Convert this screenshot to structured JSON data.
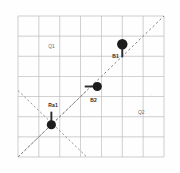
{
  "figure": {
    "background_color": "#fefefe",
    "plot_area": {
      "x": 18,
      "y": 16,
      "width": 146,
      "height": 141
    }
  },
  "chart_data": {
    "type": "scatter",
    "title": "",
    "xlabel": "",
    "ylabel": "",
    "xlim": [
      0,
      7
    ],
    "ylim": [
      0,
      7
    ],
    "grid": true,
    "grid_color": "#b9b9b9",
    "legend": "none",
    "points": [
      {
        "name": "B1",
        "label": "B1",
        "x": 5.0,
        "y": 5.6,
        "marker": "filled-circle",
        "radius": 5.2,
        "color": "#1c1c1c",
        "label_dx": -10,
        "label_dy": 10
      },
      {
        "name": "B2",
        "label": "B2",
        "x": 3.8,
        "y": 3.5,
        "marker": "filled-circle",
        "radius": 4.6,
        "color": "#1c1c1c",
        "label_dx": -7,
        "label_dy": 11
      },
      {
        "name": "Ra1",
        "label": "Ra1",
        "x": 1.6,
        "y": 1.6,
        "marker": "filled-circle",
        "radius": 4.6,
        "color": "#1c1c1c",
        "label_dx": -3,
        "label_dy": -22
      }
    ],
    "connectors": [
      {
        "name": "b1-stem",
        "from_point": "B1",
        "orientation": "vertical",
        "to_x": 5.0,
        "to_y": 4.95,
        "color": "#2a2a2a"
      },
      {
        "name": "b2-stem",
        "from_point": "B2",
        "orientation": "horizontal",
        "to_x": 3.2,
        "to_y": 3.5,
        "color": "#2a2a2a"
      },
      {
        "name": "ra1-stem",
        "from_point": "Ra1",
        "orientation": "vertical",
        "to_x": 1.6,
        "to_y": 2.25,
        "color": "#2a2a2a"
      }
    ],
    "diagonal_line": {
      "name": "identity-diagonal",
      "style": "dashed",
      "color": "#808080",
      "x1": 0.0,
      "y1": 0.0,
      "x2": 7.0,
      "y2": 7.0
    },
    "cross_lines": [
      {
        "name": "cross-ascending",
        "style": "dashed",
        "color": "#8c8c8c",
        "x1": 0.0,
        "y1": 0.0,
        "x2": 3.3,
        "y2": 3.3
      },
      {
        "name": "cross-descending",
        "style": "dashed",
        "color": "#8c8c8c",
        "x1": 0.0,
        "y1": 3.3,
        "x2": 3.3,
        "y2": 0.0
      }
    ],
    "region_labels": [
      {
        "name": "region-q1",
        "text": "Q1",
        "x": 1.45,
        "y": 5.6
      },
      {
        "name": "region-q2",
        "text": "Q2",
        "x": 5.75,
        "y": 2.35
      }
    ]
  }
}
